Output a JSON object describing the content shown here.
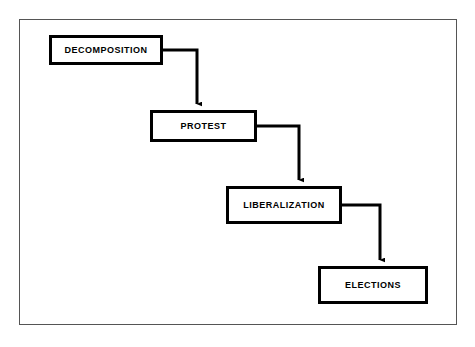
{
  "diagram": {
    "type": "flowchart",
    "orientation": "cascading-down-right",
    "frame": {
      "border_color": "#555555",
      "background_color": "#ffffff"
    },
    "style": {
      "node_border_color": "#000000",
      "node_fill_color": "#ffffff",
      "connector_color": "#000000",
      "text_color": "#000000"
    },
    "nodes": [
      {
        "id": "decomposition",
        "label": "DECOMPOSITION",
        "x": 49,
        "y": 35,
        "width": 114,
        "height": 30
      },
      {
        "id": "protest",
        "label": "PROTEST",
        "x": 150,
        "y": 110,
        "width": 107,
        "height": 32
      },
      {
        "id": "liberalization",
        "label": "LIBERALIZATION",
        "x": 226,
        "y": 186,
        "width": 116,
        "height": 38
      },
      {
        "id": "elections",
        "label": "ELECTIONS",
        "x": 318,
        "y": 266,
        "width": 110,
        "height": 38
      }
    ],
    "connectors": [
      {
        "id": "decomposition-to-protest",
        "from": "decomposition",
        "to": "protest",
        "path": "M163,50 L197,50 L197,104",
        "arrowhead": "down"
      },
      {
        "id": "protest-to-liberalization",
        "from": "protest",
        "to": "liberalization",
        "path": "M257,126 L299,126 L299,180",
        "arrowhead": "down"
      },
      {
        "id": "liberalization-to-elections",
        "from": "liberalization",
        "to": "elections",
        "path": "M342,205 L380,205 L380,260",
        "arrowhead": "down"
      }
    ]
  }
}
